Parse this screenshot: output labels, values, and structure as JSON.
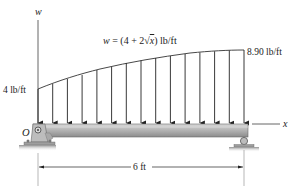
{
  "diagram": {
    "type": "distributed-load-beam",
    "axis_labels": {
      "vertical": "w",
      "horizontal": "x",
      "origin": "O"
    },
    "load_equation": "w = (4 + 2√x) lb/ft",
    "load_equation_parts": {
      "lhs": "w",
      "eq": " = (4 + 2",
      "sqrt": "√",
      "var": "x",
      "rest": ") lb/ft"
    },
    "left_intensity": "4 lb/ft",
    "right_intensity": "8.90 lb/ft",
    "span_dimension": "6 ft",
    "arrow_count": 15,
    "supports": {
      "left": "pin support",
      "right": "roller support"
    },
    "colors": {
      "line": "#222222",
      "beam_top": "#c9c9c9",
      "beam_bottom": "#8a8a8a",
      "ground": "#9a9a9a",
      "support": "#b5b5b5"
    }
  }
}
